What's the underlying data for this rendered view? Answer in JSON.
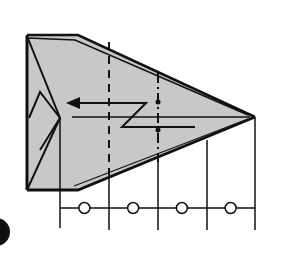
{
  "diagram": {
    "type": "origami-fold-step",
    "colors": {
      "paper": "#c8c8c8",
      "line": "#111111",
      "background": "#ffffff"
    },
    "fold_lines": [
      {
        "name": "valley-fold-line",
        "style": "dashed"
      },
      {
        "name": "mountain-fold-line",
        "style": "dash-dot"
      }
    ],
    "arrow": {
      "name": "fold-arrow",
      "direction": "left",
      "kind": "inside-reverse-fold"
    },
    "measurement": {
      "divisions": 4,
      "equal_marks": [
        "○",
        "○",
        "○",
        "○"
      ]
    },
    "step_marker": {
      "shape": "filled-circle",
      "label": ""
    }
  }
}
